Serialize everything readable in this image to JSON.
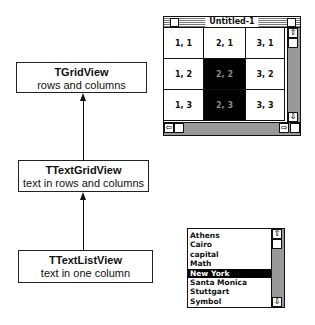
{
  "diagram": {
    "classes": [
      {
        "name": "TGridView",
        "description": "rows and columns"
      },
      {
        "name": "TTextGridView",
        "description": "text in rows and columns"
      },
      {
        "name": "TTextListView",
        "description": "text in one column"
      }
    ],
    "relations": [
      {
        "from": "TTextGridView",
        "to": "TGridView",
        "type": "inherits"
      },
      {
        "from": "TTextListView",
        "to": "TTextGridView",
        "type": "inherits"
      }
    ]
  },
  "grid_window": {
    "title": "Untitled-1",
    "cells": [
      [
        {
          "label": "1, 1",
          "selected": false
        },
        {
          "label": "2, 1",
          "selected": false
        },
        {
          "label": "3, 1",
          "selected": false
        }
      ],
      [
        {
          "label": "1, 2",
          "selected": false
        },
        {
          "label": "2, 2",
          "selected": true
        },
        {
          "label": "3, 2",
          "selected": false
        }
      ],
      [
        {
          "label": "1, 3",
          "selected": false
        },
        {
          "label": "2, 3",
          "selected": true
        },
        {
          "label": "3, 3",
          "selected": false
        }
      ]
    ]
  },
  "list_view": {
    "items": [
      "Athens",
      "Cairo",
      "capital",
      "Math",
      "New York",
      "Santa Monica",
      "Stuttgart",
      "Symbol"
    ],
    "selected": "New York"
  },
  "icons": {
    "up": "⇧",
    "down": "⇩",
    "left": "⇦",
    "right": "⇨"
  }
}
